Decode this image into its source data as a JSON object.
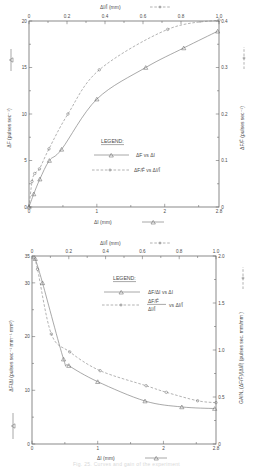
{
  "figure": {
    "caption": "Fig. 25.  Curves and gain of the experiment"
  },
  "panel_top": {
    "top_axis_label": "ΔI/Ī  (mm)",
    "top_axis_legend_marker": "dashed-dot-line",
    "bottom_axis_label": "ΔI  (mm)",
    "bottom_axis_legend_marker": "solid-triangle-line",
    "left_axis_label": "ΔF (pulses sec⁻¹)",
    "left_axis_legend_marker": "solid-triangle-line",
    "right_axis_label": "ΔF/F̄ (pulses sec⁻¹)",
    "right_axis_legend_marker": "dashed-dot-line",
    "legend_title": "LEGEND:",
    "legend": [
      {
        "marker": "solid-triangle-line",
        "label": "ΔF vs ΔI"
      },
      {
        "marker": "dashed-dot-line",
        "label": "ΔF/F̄ vs ΔI/Ī"
      }
    ],
    "ticks": {
      "top": [
        "0",
        "0.2",
        "0.4",
        "0.6",
        "0.8",
        "1.0"
      ],
      "bottom": [
        "0",
        "1",
        "2",
        "2.8"
      ],
      "left": [
        "0",
        "5",
        "10",
        "15",
        "20"
      ],
      "right": [
        "0",
        "0.1",
        "0.2",
        "0.3",
        "0.4"
      ]
    }
  },
  "panel_bottom": {
    "top_axis_label": "ΔI/Ī  (mm)",
    "top_axis_legend_marker": "dashed-dot-line",
    "bottom_axis_label": "ΔI  (mm)",
    "bottom_axis_legend_marker": "solid-triangle-line",
    "left_axis_label": "ΔF/ΔI (pulses sec⁻¹ mm⁻¹ mm²)",
    "left_axis_legend_marker": "solid-triangle-line",
    "right_axis_label": "GAIN, (ΔF/F̄)/(ΔI/Ī) (pulses sec. mm/mm )",
    "right_axis_legend_marker": "dashed-dot-line",
    "legend_title": "LEGEND:",
    "legend": [
      {
        "marker": "solid-triangle-line",
        "label": "ΔF/ΔI vs ΔI"
      },
      {
        "marker": "dashed-dot-line",
        "label": "(ΔF/F̄)/(ΔI/Ī) vs ΔI/Ī"
      }
    ],
    "ticks": {
      "top": [
        "0",
        "0.2",
        "0.4",
        "0.6",
        "0.8",
        "1.0"
      ],
      "bottom": [
        "0",
        "1",
        "2",
        "2.8"
      ],
      "left": [
        "0",
        "10",
        "20",
        "30",
        "35"
      ],
      "right": [
        "0",
        "0.5",
        "1.0",
        "1.5",
        "2.0"
      ]
    }
  },
  "chart_data": [
    {
      "type": "line",
      "title": "ΔF and ΔF/F̄ versus stimulus amplitude",
      "xlabel": "ΔI  (mm)",
      "ylabel": "ΔF (pulses sec⁻¹)",
      "xlabel_top": "ΔI/Ī  (mm)",
      "ylabel_right": "ΔF/F̄ (pulses sec⁻¹)",
      "xlim": [
        0,
        2.8
      ],
      "ylim": [
        0,
        20
      ],
      "xlim_top": [
        0,
        1.0
      ],
      "ylim_right": [
        0,
        0.4
      ],
      "grid": false,
      "legend_position": "center",
      "series": [
        {
          "name": "ΔF vs ΔI",
          "marker": "triangle",
          "linestyle": "solid",
          "axes": "bottom-left",
          "points": [
            {
              "x": 0.0,
              "y": 0.0
            },
            {
              "x": 0.07,
              "y": 1.4
            },
            {
              "x": 0.16,
              "y": 3.0
            },
            {
              "x": 0.3,
              "y": 5.0
            },
            {
              "x": 0.48,
              "y": 6.2
            },
            {
              "x": 1.0,
              "y": 11.6
            },
            {
              "x": 1.72,
              "y": 15.0
            },
            {
              "x": 2.28,
              "y": 17.1
            },
            {
              "x": 2.78,
              "y": 18.9
            }
          ]
        },
        {
          "name": "ΔF/F̄ vs ΔI/Ī",
          "marker": "dot",
          "linestyle": "dashed",
          "axes": "top-right",
          "points": [
            {
              "x": 0.0,
              "y": 0.0
            },
            {
              "x": 0.016,
              "y": 0.055
            },
            {
              "x": 0.03,
              "y": 0.072
            },
            {
              "x": 0.055,
              "y": 0.082
            },
            {
              "x": 0.105,
              "y": 0.125
            },
            {
              "x": 0.205,
              "y": 0.2
            },
            {
              "x": 0.37,
              "y": 0.295
            },
            {
              "x": 0.73,
              "y": 0.382
            },
            {
              "x": 1.0,
              "y": 0.402
            }
          ]
        }
      ]
    },
    {
      "type": "line",
      "title": "Slope ΔF/ΔI and gain versus stimulus amplitude",
      "xlabel": "ΔI  (mm)",
      "ylabel": "ΔF/ΔI (pulses sec⁻¹ mm⁻¹ mm²)",
      "xlabel_top": "ΔI/Ī  (mm)",
      "ylabel_right": "GAIN, (ΔF/F̄)/(ΔI/Ī) (pulses sec. mm/mm )",
      "xlim": [
        0,
        2.8
      ],
      "ylim": [
        0,
        35
      ],
      "xlim_top": [
        0,
        1.0
      ],
      "ylim_right": [
        0,
        2.0
      ],
      "grid": false,
      "legend_position": "upper-center",
      "series": [
        {
          "name": "ΔF/ΔI vs ΔI",
          "marker": "triangle",
          "linestyle": "solid",
          "axes": "bottom-left",
          "points": [
            {
              "x": 0.05,
              "y": 34.5
            },
            {
              "x": 0.16,
              "y": 30.0
            },
            {
              "x": 0.48,
              "y": 15.8
            },
            {
              "x": 0.56,
              "y": 14.6
            },
            {
              "x": 1.0,
              "y": 11.6
            },
            {
              "x": 1.72,
              "y": 8.0
            },
            {
              "x": 2.28,
              "y": 6.9
            },
            {
              "x": 2.78,
              "y": 6.6
            }
          ]
        },
        {
          "name": "(ΔF/F̄)/(ΔI/Ī) vs ΔI/Ī",
          "marker": "dot",
          "linestyle": "dashed",
          "axes": "top-right",
          "points": [
            {
              "x": 0.012,
              "y": 1.98
            },
            {
              "x": 0.03,
              "y": 1.86
            },
            {
              "x": 0.105,
              "y": 1.17
            },
            {
              "x": 0.205,
              "y": 0.98
            },
            {
              "x": 0.37,
              "y": 0.78
            },
            {
              "x": 0.62,
              "y": 0.62
            },
            {
              "x": 0.73,
              "y": 0.55
            },
            {
              "x": 0.9,
              "y": 0.46
            },
            {
              "x": 1.0,
              "y": 0.44
            }
          ]
        }
      ]
    }
  ]
}
